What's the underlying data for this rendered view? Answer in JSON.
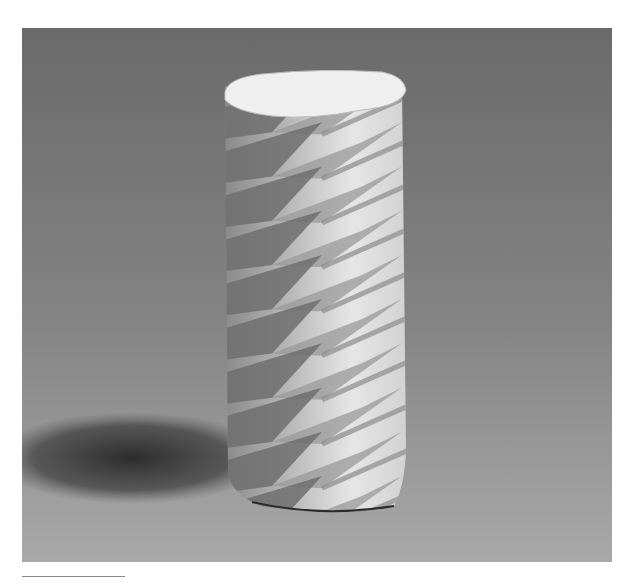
{
  "figure": {
    "background": "gray studio backdrop with gradient",
    "colors": {
      "backdrop_top": "#6c6c6c",
      "backdrop_bottom": "#a8a8a8",
      "paper_light": "#eeeeee",
      "paper_mid": "#bdbdbd",
      "paper_dark": "#6e6e6e",
      "shadow": "#2e2e2e",
      "page": "#ffffff",
      "rule": "#8a8a8a"
    },
    "fold_rows": 9
  }
}
